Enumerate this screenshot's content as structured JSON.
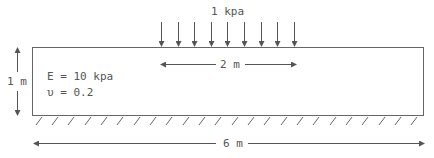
{
  "diagram": {
    "type": "structural-load-diagram",
    "load": {
      "label": "1 kpa",
      "arrow_count": 9
    },
    "load_width": {
      "label": "2 m"
    },
    "height": {
      "label": "1 m"
    },
    "width": {
      "label": "6 m"
    },
    "material": {
      "modulus_label": "E = 10 kpa",
      "poisson_label": "υ = 0.2"
    },
    "support": {
      "type": "fixed-base",
      "hatch_count": 24
    },
    "colors": {
      "line": "#555555",
      "text": "#555555",
      "background": "#ffffff"
    }
  }
}
